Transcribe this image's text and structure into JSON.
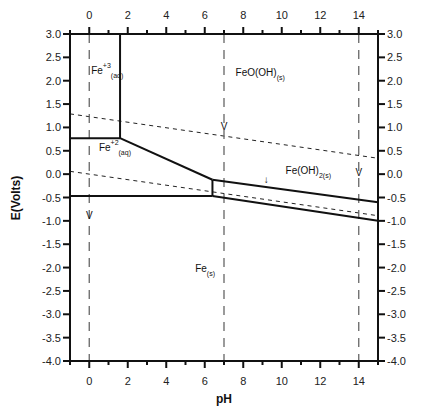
{
  "chart_data": {
    "type": "line",
    "title": "",
    "xlabel": "pH",
    "ylabel": "E(Volts)",
    "xlim": [
      -1,
      15
    ],
    "ylim": [
      -4.0,
      3.0
    ],
    "x_ticks": [
      "0",
      "2",
      "4",
      "6",
      "8",
      "10",
      "12",
      "14"
    ],
    "y_ticks": [
      "3.0",
      "2.5",
      "2.0",
      "1.5",
      "1.0",
      "0.5",
      "0.0",
      "-0.5",
      "-1.0",
      "-1.5",
      "-2.0",
      "-2.5",
      "-3.0",
      "-3.5",
      "-4.0"
    ],
    "grid": false,
    "regions": [
      {
        "name": "Fe+3(aq)",
        "main": "Fe",
        "sup": "+3",
        "sub": "(aq)",
        "x": 0.1,
        "y": 2.15
      },
      {
        "name": "FeO(OH)(s)",
        "main": "FeO(OH)",
        "sup": "",
        "sub": "(s)",
        "x": 7.6,
        "y": 2.1
      },
      {
        "name": "Fe+2(aq)",
        "main": "Fe",
        "sup": "+2",
        "sub": "(aq)",
        "x": 0.5,
        "y": 0.5
      },
      {
        "name": "Fe(OH)2(s)",
        "main": "Fe(OH)",
        "sup": "",
        "sub": "2(s)",
        "x": 10.2,
        "y": 0.0
      },
      {
        "name": "Fe(s)",
        "main": "Fe",
        "sup": "",
        "sub": "(s)",
        "x": 5.5,
        "y": -2.1
      }
    ],
    "series": [
      {
        "name": "Fe3+/Fe2+",
        "style": "solid",
        "x": [
          -1,
          1.6
        ],
        "y": [
          0.77,
          0.77
        ]
      },
      {
        "name": "Fe3+/FeO(OH)",
        "style": "solid",
        "x": [
          1.6,
          1.6
        ],
        "y": [
          0.77,
          3.0
        ]
      },
      {
        "name": "FeO(OH)/Fe2+",
        "style": "solid",
        "x": [
          1.6,
          6.4
        ],
        "y": [
          0.77,
          -0.12
        ]
      },
      {
        "name": "Fe2+/Fe(OH)2",
        "style": "solid",
        "x": [
          6.4,
          6.4
        ],
        "y": [
          -0.12,
          -0.47
        ]
      },
      {
        "name": "Fe2+/Fe",
        "style": "solid",
        "x": [
          -1,
          6.4
        ],
        "y": [
          -0.47,
          -0.47
        ]
      },
      {
        "name": "FeO(OH)/Fe(OH)2",
        "style": "solid",
        "x": [
          6.4,
          15
        ],
        "y": [
          -0.12,
          -0.6
        ]
      },
      {
        "name": "Fe(OH)2/Fe",
        "style": "solid",
        "x": [
          6.4,
          15
        ],
        "y": [
          -0.47,
          -1.0
        ]
      },
      {
        "name": "O2/H2O",
        "style": "dashed",
        "x": [
          -1,
          15
        ],
        "y": [
          1.29,
          0.34
        ]
      },
      {
        "name": "H+/H2",
        "style": "dashed",
        "x": [
          -1,
          15
        ],
        "y": [
          0.06,
          -0.89
        ]
      },
      {
        "name": "pH 0",
        "style": "dashed-vertical",
        "x": [
          0,
          0
        ],
        "y": [
          3.0,
          -4.0
        ]
      },
      {
        "name": "pH 7",
        "style": "dashed-vertical",
        "x": [
          7,
          7
        ],
        "y": [
          3.0,
          -4.0
        ]
      },
      {
        "name": "pH 14",
        "style": "dashed-vertical",
        "x": [
          14,
          14
        ],
        "y": [
          3.0,
          -4.0
        ]
      }
    ],
    "annotations": [
      {
        "text": "V",
        "x": 7.0,
        "y": 0.95
      },
      {
        "text": "V",
        "x": 14.0,
        "y": -0.05
      },
      {
        "text": "V",
        "x": 0.0,
        "y": -0.95
      },
      {
        "text": "↓",
        "x": 9.2,
        "y": -0.2
      }
    ]
  }
}
